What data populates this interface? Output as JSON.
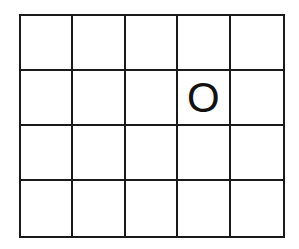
{
  "board": {
    "rows": 4,
    "cols": 5,
    "cells": [
      [
        "",
        "",
        "",
        "",
        ""
      ],
      [
        "",
        "",
        "",
        "O",
        ""
      ],
      [
        "",
        "",
        "",
        "",
        ""
      ],
      [
        "",
        "",
        "",
        "",
        ""
      ]
    ]
  },
  "colors": {
    "grid_line": "#1a1a1a",
    "background": "#ffffff",
    "mark": "#111111"
  }
}
